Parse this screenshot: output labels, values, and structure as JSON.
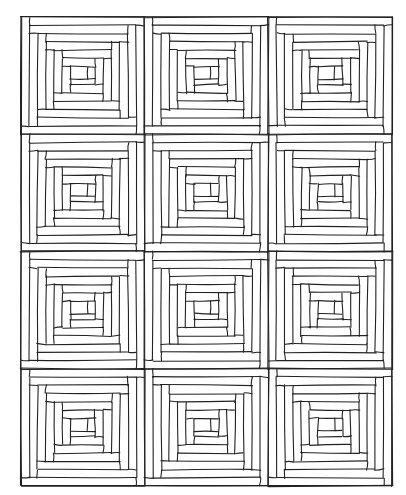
{
  "illustration": {
    "subject": "log cabin quilt coloring page",
    "line_color": "#222222",
    "background": "#ffffff",
    "quilt_bounds": {
      "x": 21,
      "y": 17,
      "width": 371,
      "height": 469
    },
    "grid": {
      "columns": 3,
      "rows": 4
    },
    "block_style": "log-cabin",
    "rings_per_block": 6,
    "center_square": true
  }
}
